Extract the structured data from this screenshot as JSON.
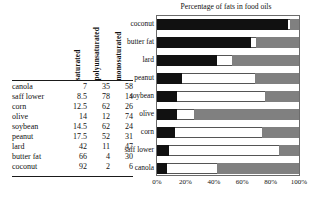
{
  "table": {
    "headers": [
      "saturated",
      "polyunsaturated",
      "monosaturated"
    ],
    "rows": [
      {
        "oil": "canola",
        "saturated": "7",
        "polyunsaturated": "35",
        "monosaturated": "58"
      },
      {
        "oil": "saff lower",
        "saturated": "8.5",
        "polyunsaturated": "78",
        "monosaturated": "14"
      },
      {
        "oil": "corn",
        "saturated": "12.5",
        "polyunsaturated": "62",
        "monosaturated": "26"
      },
      {
        "oil": "olive",
        "saturated": "14",
        "polyunsaturated": "12",
        "monosaturated": "74"
      },
      {
        "oil": "soybean",
        "saturated": "14.5",
        "polyunsaturated": "62",
        "monosaturated": "24"
      },
      {
        "oil": "peanut",
        "saturated": "17.5",
        "polyunsaturated": "52",
        "monosaturated": "31"
      },
      {
        "oil": "lard",
        "saturated": "42",
        "polyunsaturated": "11",
        "monosaturated": "47"
      },
      {
        "oil": "butter fat",
        "saturated": "66",
        "polyunsaturated": "4",
        "monosaturated": "30"
      },
      {
        "oil": "coconut",
        "saturated": "92",
        "polyunsaturated": "2",
        "monosaturated": "6"
      }
    ]
  },
  "chart_data": {
    "type": "bar",
    "orientation": "horizontal",
    "stacked": true,
    "title": "Percentage of fats in food oils",
    "xlabel": "",
    "ylabel": "",
    "xlim": [
      0,
      100
    ],
    "xticks": [
      0,
      20,
      40,
      60,
      80,
      100
    ],
    "xtick_labels": [
      "0%",
      "20%",
      "40%",
      "60%",
      "80%",
      "100%"
    ],
    "grid": false,
    "legend": "none",
    "categories": [
      "coconut",
      "butter fat",
      "lard",
      "peanut",
      "soybean",
      "olive",
      "corn",
      "saff lower",
      "canola"
    ],
    "series": [
      {
        "name": "saturated",
        "color": "#111111",
        "values": [
          92,
          66,
          42,
          17.5,
          14.5,
          14,
          12.5,
          8.5,
          7
        ]
      },
      {
        "name": "polyunsaturated",
        "color": "#ffffff",
        "values": [
          2,
          4,
          11,
          52,
          62,
          12,
          62,
          78,
          35
        ]
      },
      {
        "name": "monosaturated",
        "color": "#808080",
        "values": [
          6,
          30,
          47,
          31,
          24,
          74,
          26,
          14,
          58
        ]
      }
    ]
  },
  "colors": {
    "saturated": "#111111",
    "polyunsaturated": "#ffffff",
    "monosaturated": "#808080",
    "frame": "#6b6b6b",
    "rule": "#1a1a1a"
  }
}
